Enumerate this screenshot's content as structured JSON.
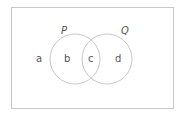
{
  "diagram": {
    "type": "venn",
    "universe": {
      "x": 11,
      "y": 7,
      "width": 163,
      "height": 102,
      "stroke": "#c8c8c8"
    },
    "sets": [
      {
        "name": "P",
        "cx": 75,
        "cy": 59,
        "r": 25,
        "label_x": 62,
        "label_y": 34,
        "stroke": "#c8c8c8"
      },
      {
        "name": "Q",
        "cx": 107,
        "cy": 59,
        "r": 25,
        "label_x": 122,
        "label_y": 34,
        "stroke": "#c8c8c8"
      }
    ],
    "regions": [
      {
        "label": "a",
        "x": 39,
        "y": 62,
        "description": "outside P and Q"
      },
      {
        "label": "b",
        "x": 67,
        "y": 62,
        "description": "P only"
      },
      {
        "label": "c",
        "x": 91,
        "y": 62,
        "description": "P and Q"
      },
      {
        "label": "d",
        "x": 118,
        "y": 62,
        "description": "Q only"
      }
    ],
    "text_color": "#555555"
  }
}
